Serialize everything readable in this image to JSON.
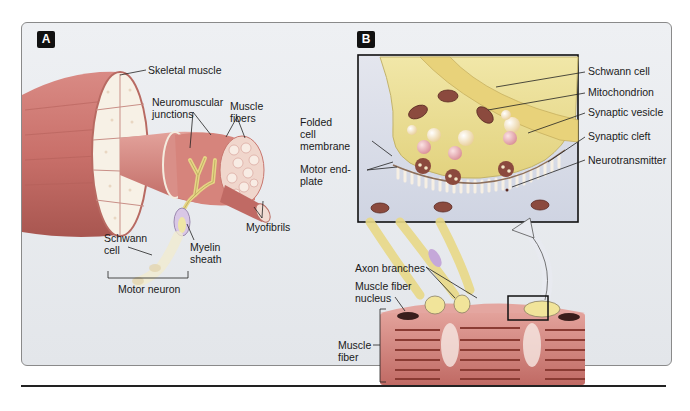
{
  "figure": {
    "panels": [
      {
        "id": "A",
        "badge": "A",
        "labels": {
          "skeletal_muscle": "Skeletal muscle",
          "neuromuscular_junctions_1": "Neuromuscular",
          "neuromuscular_junctions_2": "junctions",
          "muscle_fibers_1": "Muscle",
          "muscle_fibers_2": "fibers",
          "myofibrils": "Myofibrils",
          "schwann_cell_1": "Schwann",
          "schwann_cell_2": "cell",
          "myelin_sheath_1": "Myelin",
          "myelin_sheath_2": "sheath",
          "motor_neuron": "Motor neuron"
        }
      },
      {
        "id": "B",
        "badge": "B",
        "labels": {
          "folded_cell_membrane_1": "Folded",
          "folded_cell_membrane_2": "cell",
          "folded_cell_membrane_3": "membrane",
          "motor_end_plate_1": "Motor end-",
          "motor_end_plate_2": "plate",
          "schwann_cell": "Schwann cell",
          "mitochondrion": "Mitochondrion",
          "synaptic_vesicle": "Synaptic vesicle",
          "synaptic_cleft": "Synaptic cleft",
          "neurotransmitter": "Neurotransmitter",
          "axon_branches": "Axon branches",
          "muscle_fiber_nucleus_1": "Muscle fiber",
          "muscle_fiber_nucleus_2": "nucleus",
          "muscle_fiber_1": "Muscle",
          "muscle_fiber_2": "fiber"
        }
      }
    ],
    "colors": {
      "muscle": "#c9706a",
      "muscle_dark": "#9e4a45",
      "nerve": "#e8d98a",
      "cross_section": "#f6f0e6",
      "panel_bg": "#e8eaed",
      "inset_bg": "#d9dde8",
      "mitochondria": "#8a3b33",
      "vesicle": "#f3e9c9"
    }
  }
}
